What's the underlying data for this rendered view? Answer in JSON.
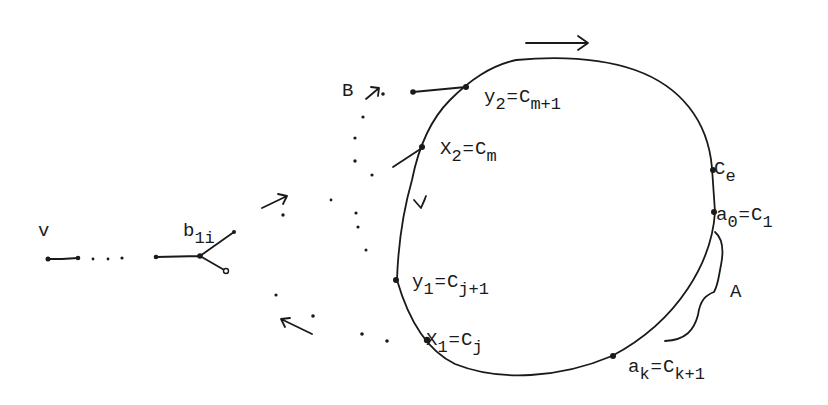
{
  "diagram": {
    "type": "graph-cycle",
    "stroke_color": "#1a1a1a",
    "background": "#ffffff",
    "labels": {
      "v": {
        "text": "v"
      },
      "b1i": {
        "base": "b",
        "sub": "1i"
      },
      "B": {
        "text": "B"
      },
      "A": {
        "text": "A"
      },
      "y2": {
        "lhs_base": "y",
        "lhs_sub": "2",
        "eq": "=",
        "rhs_base": "C",
        "rhs_sub": "m+1"
      },
      "x2": {
        "lhs_base": "X",
        "lhs_sub": "2",
        "eq": "=",
        "rhs_base": "C",
        "rhs_sub": "m"
      },
      "ce": {
        "base": "C",
        "sub": "e"
      },
      "a0": {
        "lhs_base": "a",
        "lhs_sub": "0",
        "eq": "=",
        "rhs_base": "C",
        "rhs_sub": "1"
      },
      "y1": {
        "lhs_base": "y",
        "lhs_sub": "1",
        "eq": "=",
        "rhs_base": "C",
        "rhs_sub": "j+1"
      },
      "x1": {
        "lhs_base": "X",
        "lhs_sub": "1",
        "eq": "=",
        "rhs_base": "C",
        "rhs_sub": "j"
      },
      "ak": {
        "lhs_base": "a",
        "lhs_sub": "k",
        "eq": "=",
        "rhs_base": "C",
        "rhs_sub": "k+1"
      }
    },
    "nodes": [
      "v",
      "b1i",
      "y2",
      "x2",
      "ce",
      "a0",
      "y1",
      "x1",
      "ak"
    ],
    "arrows": [
      {
        "name": "cycle-direction-top",
        "direction": "right"
      },
      {
        "name": "cycle-direction-left",
        "direction": "down"
      },
      {
        "name": "path-B-arrow",
        "direction": "up-right"
      },
      {
        "name": "path-out-arrow",
        "direction": "up-right"
      },
      {
        "name": "path-in-arrow",
        "direction": "up-left"
      }
    ]
  }
}
